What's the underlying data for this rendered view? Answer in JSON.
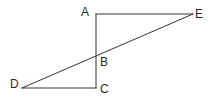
{
  "figure": {
    "type": "line-diagram",
    "title": "",
    "width": 215,
    "height": 104,
    "background_color": "#ffffff",
    "stroke_color": "#333333",
    "stroke_width": 1,
    "points": {
      "A": {
        "label": "A",
        "x": 96,
        "y": 14,
        "label_x": 81,
        "label_y": 6
      },
      "B": {
        "label": "B",
        "x": 96,
        "y": 59,
        "label_x": 100,
        "label_y": 56
      },
      "C": {
        "label": "C",
        "x": 96,
        "y": 88,
        "label_x": 100,
        "label_y": 83
      },
      "D": {
        "label": "D",
        "x": 22,
        "y": 88,
        "label_x": 10,
        "label_y": 78
      },
      "E": {
        "label": "E",
        "x": 193,
        "y": 14,
        "label_x": 195,
        "label_y": 8
      }
    },
    "segments": [
      {
        "name": "segment-AE",
        "from": "A",
        "to": "E"
      },
      {
        "name": "segment-AC",
        "from": "A",
        "to": "C"
      },
      {
        "name": "segment-DC",
        "from": "D",
        "to": "C"
      },
      {
        "name": "segment-DE",
        "from": "D",
        "to": "E"
      }
    ]
  }
}
